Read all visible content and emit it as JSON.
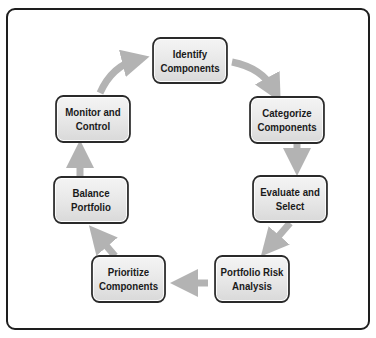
{
  "diagram": {
    "type": "cycle",
    "title": "",
    "steps": [
      {
        "id": "identify",
        "label": "Identify\nComponents"
      },
      {
        "id": "categorize",
        "label": "Categorize\nComponents"
      },
      {
        "id": "evaluate",
        "label": "Evaluate and\nSelect"
      },
      {
        "id": "risk",
        "label": "Portfolio Risk\nAnalysis"
      },
      {
        "id": "prioritize",
        "label": "Prioritize\nComponents"
      },
      {
        "id": "balance",
        "label": "Balance\nPortfolio"
      },
      {
        "id": "monitor",
        "label": "Monitor and\nControl"
      }
    ],
    "flow": [
      [
        "identify",
        "categorize"
      ],
      [
        "categorize",
        "evaluate"
      ],
      [
        "evaluate",
        "risk"
      ],
      [
        "risk",
        "prioritize"
      ],
      [
        "prioritize",
        "balance"
      ],
      [
        "balance",
        "monitor"
      ],
      [
        "monitor",
        "identify"
      ]
    ],
    "colors": {
      "arrow": "#b3b3b3",
      "box_border": "#2a2a2a",
      "box_fill": "#e8e8e8",
      "frame_border": "#1e1e1e"
    }
  }
}
